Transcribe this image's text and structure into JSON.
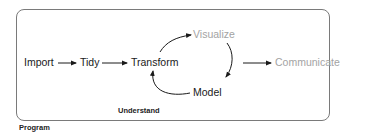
{
  "diagram": {
    "nodes": {
      "import": "Import",
      "tidy": "Tidy",
      "transform": "Transform",
      "visualize": "Visualize",
      "model": "Model",
      "communicate": "Communicate"
    },
    "groups": {
      "understand": "Understand",
      "program": "Program"
    },
    "edges": [
      {
        "from": "Import",
        "to": "Tidy"
      },
      {
        "from": "Tidy",
        "to": "Transform"
      },
      {
        "from": "Transform",
        "to": "Visualize"
      },
      {
        "from": "Visualize",
        "to": "Model"
      },
      {
        "from": "Model",
        "to": "Transform"
      },
      {
        "from": "Understand",
        "to": "Communicate"
      }
    ],
    "colors": {
      "primary_text": "#1a1a1a",
      "muted_text": "#a3a3a3",
      "frame_border": "#7a7a7a",
      "arrow": "#1a1a1a"
    }
  }
}
